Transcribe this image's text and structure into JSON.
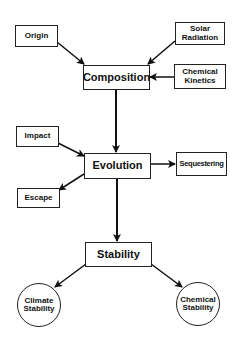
{
  "diagram": {
    "nodes": {
      "origin": {
        "label": "Origin"
      },
      "solar_radiation": {
        "line1": "Solar",
        "line2": "Radiation"
      },
      "composition": {
        "label": "Composition"
      },
      "chemical_kinetics": {
        "line1": "Chemical",
        "line2": "Kinetics"
      },
      "impact": {
        "label": "Impact"
      },
      "evolution": {
        "label": "Evolution"
      },
      "sequestering": {
        "label": "Sequestering"
      },
      "escape": {
        "label": "Escape"
      },
      "stability": {
        "label": "Stability"
      },
      "climate_stability": {
        "line1": "Climate",
        "line2": "Stability"
      },
      "chemical_stability": {
        "line1": "Chemical",
        "line2": "Stability"
      }
    },
    "edges": [
      {
        "from": "Origin",
        "to": "Composition"
      },
      {
        "from": "Solar Radiation",
        "to": "Composition"
      },
      {
        "from": "Chemical Kinetics",
        "to": "Composition"
      },
      {
        "from": "Composition",
        "to": "Evolution"
      },
      {
        "from": "Impact",
        "to": "Evolution"
      },
      {
        "from": "Evolution",
        "to": "Escape"
      },
      {
        "from": "Evolution",
        "to": "Sequestering"
      },
      {
        "from": "Evolution",
        "to": "Stability"
      },
      {
        "from": "Stability",
        "to": "Climate Stability"
      },
      {
        "from": "Stability",
        "to": "Chemical Stability"
      }
    ]
  }
}
